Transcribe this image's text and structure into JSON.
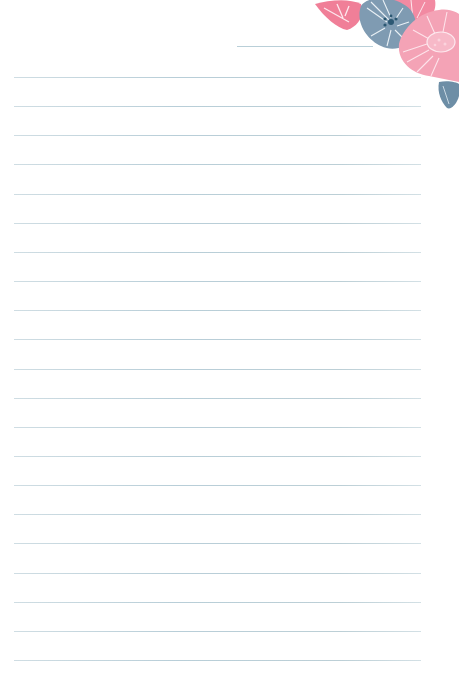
{
  "page": {
    "type": "lined-stationery",
    "background": "#ffffff",
    "line_color": "#b8ced8",
    "title_line": {
      "x": 237,
      "y": 46,
      "width": 136
    },
    "ruled_lines": {
      "count": 21,
      "start_y": 77,
      "spacing": 29.15,
      "x": 14,
      "width": 407
    }
  },
  "decoration": {
    "name": "floral-corner",
    "colors": {
      "pink": "#f07f98",
      "light_pink": "#f4a3b6",
      "slate_blue": "#7f9bb2",
      "dark_teal": "#2c5873",
      "leaf_blue": "#6d8ea6"
    }
  }
}
